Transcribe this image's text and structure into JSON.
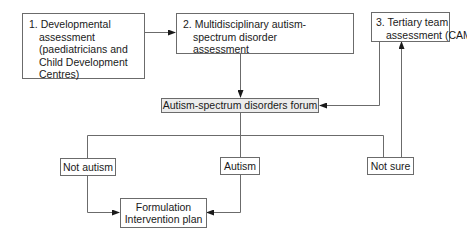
{
  "diagram": {
    "type": "flowchart",
    "nodes": {
      "developmental": {
        "lines": [
          "1. Developmental",
          "assessment",
          "(paediatricians and",
          "Child Development",
          "Centres)"
        ]
      },
      "multidisciplinary": {
        "lines": [
          "2. Multidisciplinary autism-",
          "spectrum disorder",
          "assessment"
        ]
      },
      "tertiary": {
        "lines": [
          "3. Tertiary team",
          "assessment (CAMHS)"
        ]
      },
      "forum": {
        "label": "Autism-spectrum disorders forum"
      },
      "not_autism": {
        "label": "Not autism"
      },
      "autism": {
        "label": "Autism"
      },
      "not_sure": {
        "label": "Not sure"
      },
      "formulation": {
        "lines": [
          "Formulation",
          "Intervention plan"
        ]
      }
    },
    "edges": [
      {
        "from": "developmental",
        "to": "multidisciplinary"
      },
      {
        "from": "multidisciplinary",
        "to": "forum"
      },
      {
        "from": "tertiary",
        "to": "forum"
      },
      {
        "from": "forum",
        "to": "not_autism"
      },
      {
        "from": "forum",
        "to": "autism"
      },
      {
        "from": "forum",
        "to": "not_sure"
      },
      {
        "from": "not_sure",
        "to": "tertiary"
      },
      {
        "from": "not_autism",
        "to": "formulation"
      },
      {
        "from": "autism",
        "to": "formulation"
      }
    ],
    "colors": {
      "line": "#6b6b6b",
      "arrowhead": "#1a1a1a",
      "forum_fill": "#ececec"
    }
  }
}
